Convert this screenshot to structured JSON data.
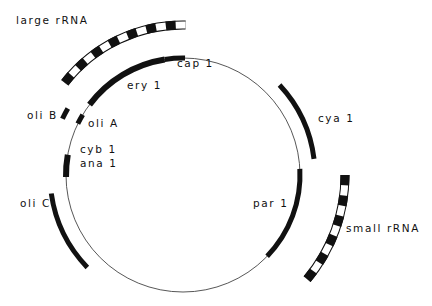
{
  "diagram": {
    "type": "circular genetic map",
    "colors": {
      "ink": "#111111",
      "background": "#ffffff",
      "circle": "#444444"
    },
    "circle": {
      "cx": 183,
      "cy": 175,
      "r": 117
    },
    "genes": [
      {
        "id": "cap1",
        "label": "cap 1",
        "start_deg": -9,
        "end_deg": 1,
        "radius": 117,
        "style": "solid",
        "width": 5
      },
      {
        "id": "ery1",
        "label": "ery 1",
        "start_deg": -53,
        "end_deg": -9,
        "radius": 117,
        "style": "solid",
        "width": 6
      },
      {
        "id": "oliA",
        "label": "oli A",
        "start_deg": -64,
        "end_deg": -59,
        "radius": 117,
        "style": "solid",
        "width": 5
      },
      {
        "id": "cyb1",
        "label": "cyb 1",
        "start_deg": -80,
        "end_deg": -91,
        "radius": 117,
        "style": "solid",
        "width": 6
      },
      {
        "id": "par1",
        "label": "par 1",
        "start_deg": 87,
        "end_deg": 134,
        "radius": 117,
        "style": "solid",
        "width": 5
      },
      {
        "id": "oliB",
        "label": "oli B",
        "start_deg": -65,
        "end_deg": -60,
        "radius": 133,
        "style": "solid",
        "width": 5
      },
      {
        "id": "oliC",
        "label": "oli C",
        "start_deg": -98,
        "end_deg": -134,
        "radius": 133,
        "style": "solid",
        "width": 5
      },
      {
        "id": "cya1",
        "label": "cya 1",
        "start_deg": 47,
        "end_deg": 83,
        "radius": 132,
        "style": "solid",
        "width": 5
      },
      {
        "id": "largeRRNA",
        "label": "large rRNA",
        "start_deg": -52,
        "end_deg": 1,
        "radius": 150,
        "style": "striped",
        "segments": 14,
        "width": 9
      },
      {
        "id": "smallRRNA",
        "label": "small rRNA",
        "start_deg": 90,
        "end_deg": 130,
        "radius": 162,
        "style": "striped",
        "segments": 11,
        "width": 9
      }
    ],
    "labels": [
      {
        "id": "largeRRNA",
        "text": "large rRNA",
        "x": 16,
        "y": 23
      },
      {
        "id": "cap1",
        "text": "cap 1",
        "x": 177,
        "y": 66
      },
      {
        "id": "ery1",
        "text": "ery 1",
        "x": 127,
        "y": 88
      },
      {
        "id": "oliB",
        "text": "oli B",
        "x": 27,
        "y": 118
      },
      {
        "id": "oliA",
        "text": "oli A",
        "x": 88,
        "y": 126
      },
      {
        "id": "cya1",
        "text": "cya 1",
        "x": 318,
        "y": 121
      },
      {
        "id": "cyb1",
        "text": "cyb 1",
        "x": 80,
        "y": 152
      },
      {
        "id": "ana1",
        "text": "ana 1",
        "x": 80,
        "y": 166
      },
      {
        "id": "oliC",
        "text": "oli C",
        "x": 20,
        "y": 206
      },
      {
        "id": "par1",
        "text": "par 1",
        "x": 253,
        "y": 206
      },
      {
        "id": "smallRRNA",
        "text": "small rRNA",
        "x": 346,
        "y": 231
      }
    ]
  }
}
